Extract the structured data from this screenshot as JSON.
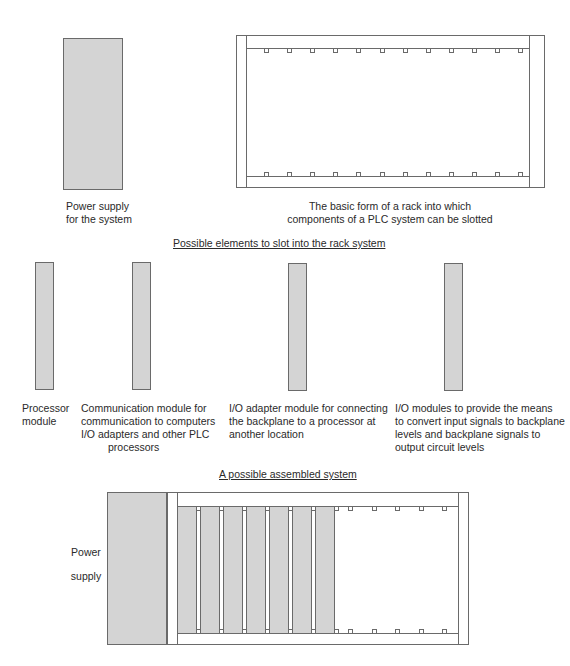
{
  "top_section": {
    "power_supply_label": "Power supply\nfor the system",
    "rack_label": "The basic form of a rack into which\ncomponents of a PLC system can be slotted",
    "rack_slot_count": 12
  },
  "elements_section": {
    "heading": "Possible elements to slot into the rack system",
    "modules": [
      {
        "name": "processor",
        "label": "Processor\nmodule"
      },
      {
        "name": "communication",
        "label": "Communication module for\ncommunication to computers\nI/O adapters and other PLC",
        "label_last_line": "processors"
      },
      {
        "name": "io-adapter",
        "label": "I/O adapter module for connecting\nthe backplane to a processor at\nanother location"
      },
      {
        "name": "io-modules",
        "label": "I/O modules to provide the means\nto convert input signals to backplane\nlevels and backplane signals to\noutput circuit levels"
      }
    ]
  },
  "assembled_section": {
    "heading": "A possible assembled system",
    "power_supply_label": "Power\n\nsupply",
    "filled_modules": 7,
    "empty_slots": 5
  },
  "colors": {
    "module_fill": "#d4d4d4",
    "line": "#6a6a6a",
    "text": "#2a2a2a"
  }
}
